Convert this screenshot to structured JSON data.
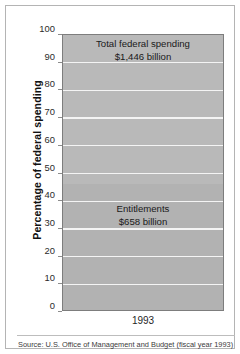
{
  "chart_data": {
    "type": "bar",
    "title": "",
    "subtitle": "",
    "xlabel": "",
    "ylabel": "Percentage of federal spending",
    "categories": [
      "1993"
    ],
    "ylim": [
      0,
      100
    ],
    "yticks": [
      0,
      10,
      20,
      30,
      40,
      50,
      60,
      70,
      80,
      90,
      100
    ],
    "ytick_labels": [
      "0",
      "10",
      "20",
      "30",
      "40",
      "50",
      "60",
      "70",
      "80",
      "90",
      "100"
    ],
    "grid": true,
    "grid_orientation": "horizontal",
    "grid_color": "#f4f4f4",
    "legend": false,
    "legend_position": "none",
    "bar_fill_color": "#b9b9b9",
    "bar_border_color": "#7d7d7d",
    "series": [
      {
        "name": "Total federal spending",
        "values": [
          100
        ],
        "value_billions": 1446,
        "label_line1": "Total federal spending",
        "label_line2": "$1,446 billion"
      },
      {
        "name": "Entitlements",
        "values": [
          45.5
        ],
        "value_billions": 658,
        "label_line1": "Entitlements",
        "label_line2": "$658 billion"
      }
    ],
    "annotations": [
      {
        "name": "total-federal-spending-label",
        "text": "Total federal spending $1,446 billion",
        "position": "top-of-bar"
      },
      {
        "name": "entitlements-label",
        "text": "Entitlements $658 billion",
        "position": "lower-middle-of-bar"
      }
    ],
    "source": "Source: U.S. Office of Management and Budget (fiscal year 1993)"
  },
  "figure": {
    "ytitle": "Percentage of federal spending",
    "xtick": "1993",
    "source": "Source: U.S. Office of Management and Budget (fiscal year 1993)",
    "total_label_line1": "Total federal spending",
    "total_label_line2": "$1,446 billion",
    "entitlements_label_line1": "Entitlements",
    "entitlements_label_line2": "$658 billion",
    "ytick_labels": [
      "100",
      "90",
      "80",
      "70",
      "60",
      "50",
      "40",
      "30",
      "20",
      "10",
      "0"
    ]
  }
}
